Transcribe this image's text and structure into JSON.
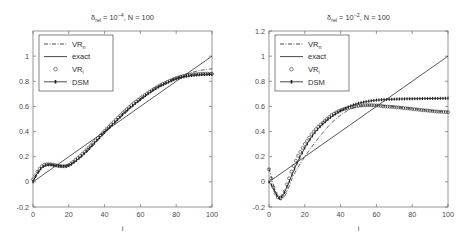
{
  "figure": {
    "background_color": "#ffffff",
    "panel_count": 2
  },
  "chart_data": [
    {
      "type": "line",
      "panel": "left",
      "title": "δ_rel = 10^-4, N = 100",
      "title_parts": {
        "delta": "δ",
        "sub": "rel",
        "eq": " = 10",
        "sup": "−4",
        "tail": ", N = 100"
      },
      "xlabel": "i",
      "ylabel": "",
      "xlim": [
        0,
        100
      ],
      "ylim": [
        -0.2,
        1.2
      ],
      "xticks": [
        0,
        20,
        40,
        60,
        80,
        100
      ],
      "xticklabels": [
        "0",
        "20",
        "40",
        "60",
        "80",
        "100"
      ],
      "yticks": [
        -0.2,
        0,
        0.2,
        0.4,
        0.6,
        0.8,
        1
      ],
      "yticklabels": [
        "-0.2",
        "0",
        "0.2",
        "0.4",
        "0.6",
        "0.8",
        "1"
      ],
      "grid": false,
      "legend_position": "upper left",
      "legend": [
        {
          "label": "VR",
          "sub": "n",
          "style": "dashdot"
        },
        {
          "label": "exact",
          "sub": "",
          "style": "solid"
        },
        {
          "label": "VR",
          "sub": "i",
          "style": "circle"
        },
        {
          "label": "DSM",
          "sub": "",
          "style": "line-marker"
        }
      ],
      "series": [
        {
          "name": "exact",
          "style": "solid",
          "x": [
            0,
            5,
            10,
            15,
            20,
            25,
            30,
            35,
            40,
            45,
            50,
            55,
            60,
            65,
            70,
            75,
            80,
            85,
            90,
            95,
            100
          ],
          "values": [
            0.0,
            0.05,
            0.1,
            0.15,
            0.2,
            0.25,
            0.3,
            0.35,
            0.4,
            0.45,
            0.5,
            0.55,
            0.6,
            0.65,
            0.7,
            0.75,
            0.8,
            0.85,
            0.9,
            0.95,
            1.0
          ]
        },
        {
          "name": "VR_n",
          "style": "dashdot",
          "x": [
            0,
            2,
            4,
            6,
            8,
            10,
            12,
            15,
            18,
            20,
            25,
            30,
            35,
            40,
            45,
            50,
            55,
            60,
            65,
            70,
            75,
            80,
            85,
            90,
            95,
            100
          ],
          "values": [
            0.01,
            0.05,
            0.09,
            0.12,
            0.13,
            0.135,
            0.135,
            0.13,
            0.13,
            0.135,
            0.175,
            0.235,
            0.31,
            0.385,
            0.455,
            0.525,
            0.59,
            0.65,
            0.705,
            0.755,
            0.795,
            0.83,
            0.855,
            0.875,
            0.89,
            0.9
          ]
        },
        {
          "name": "VR_i",
          "style": "circle",
          "x": [
            0,
            2,
            4,
            6,
            8,
            10,
            12,
            15,
            18,
            20,
            25,
            30,
            35,
            40,
            45,
            50,
            55,
            60,
            65,
            70,
            75,
            80,
            85,
            90,
            95,
            100
          ],
          "values": [
            0.02,
            0.07,
            0.11,
            0.135,
            0.14,
            0.14,
            0.135,
            0.125,
            0.125,
            0.135,
            0.19,
            0.255,
            0.33,
            0.405,
            0.475,
            0.545,
            0.61,
            0.665,
            0.715,
            0.76,
            0.795,
            0.825,
            0.845,
            0.855,
            0.86,
            0.86
          ]
        },
        {
          "name": "DSM",
          "style": "line-marker",
          "x": [
            0,
            2,
            4,
            6,
            8,
            10,
            12,
            15,
            18,
            20,
            25,
            30,
            35,
            40,
            45,
            50,
            55,
            60,
            65,
            70,
            75,
            80,
            85,
            90,
            95,
            100
          ],
          "values": [
            0.0,
            0.06,
            0.1,
            0.125,
            0.135,
            0.135,
            0.13,
            0.125,
            0.125,
            0.13,
            0.18,
            0.245,
            0.32,
            0.395,
            0.465,
            0.535,
            0.6,
            0.655,
            0.71,
            0.755,
            0.79,
            0.82,
            0.838,
            0.848,
            0.853,
            0.855
          ]
        }
      ]
    },
    {
      "type": "line",
      "panel": "right",
      "title": "δ_rel = 10^-2, N = 100",
      "title_parts": {
        "delta": "δ",
        "sub": "rel",
        "eq": " = 10",
        "sup": "−2",
        "tail": ", N = 100"
      },
      "xlabel": "i",
      "ylabel": "",
      "xlim": [
        0,
        100
      ],
      "ylim": [
        -0.2,
        1.2
      ],
      "xticks": [
        0,
        20,
        40,
        60,
        80,
        100
      ],
      "xticklabels": [
        "0",
        "20",
        "40",
        "60",
        "80",
        "100"
      ],
      "yticks": [
        -0.2,
        0,
        0.2,
        0.4,
        0.6,
        0.8,
        1,
        1.2
      ],
      "yticklabels": [
        "-0.2",
        "0",
        "0.2",
        "0.4",
        "0.6",
        "0.8",
        "1",
        "1.2"
      ],
      "grid": false,
      "legend_position": "upper left",
      "legend": [
        {
          "label": "VR",
          "sub": "n",
          "style": "dashdot"
        },
        {
          "label": "exact",
          "sub": "",
          "style": "solid"
        },
        {
          "label": "VR",
          "sub": "i",
          "style": "circle"
        },
        {
          "label": "DSM",
          "sub": "",
          "style": "line-marker"
        }
      ],
      "series": [
        {
          "name": "exact",
          "style": "solid",
          "x": [
            0,
            5,
            10,
            15,
            20,
            25,
            30,
            35,
            40,
            45,
            50,
            55,
            60,
            65,
            70,
            75,
            80,
            85,
            90,
            95,
            100
          ],
          "values": [
            0.0,
            0.05,
            0.1,
            0.15,
            0.2,
            0.25,
            0.3,
            0.35,
            0.4,
            0.45,
            0.5,
            0.55,
            0.6,
            0.65,
            0.7,
            0.75,
            0.8,
            0.85,
            0.9,
            0.95,
            1.0
          ]
        },
        {
          "name": "VR_n",
          "style": "dashdot",
          "x": [
            0,
            2,
            4,
            6,
            8,
            10,
            13,
            16,
            20,
            25,
            30,
            35,
            40,
            45,
            50,
            55,
            60,
            65,
            70,
            75,
            80,
            85,
            90,
            95,
            100
          ],
          "values": [
            0.11,
            0.0,
            -0.09,
            -0.14,
            -0.13,
            -0.08,
            0.03,
            0.11,
            0.2,
            0.3,
            0.39,
            0.47,
            0.53,
            0.575,
            0.6,
            0.61,
            0.61,
            0.605,
            0.6,
            0.59,
            0.585,
            0.575,
            0.568,
            0.562,
            0.558
          ]
        },
        {
          "name": "VR_i",
          "style": "circle",
          "x": [
            0,
            2,
            4,
            6,
            8,
            10,
            13,
            16,
            20,
            25,
            30,
            35,
            40,
            45,
            50,
            55,
            60,
            65,
            70,
            75,
            80,
            85,
            90,
            95,
            100
          ],
          "values": [
            0.1,
            -0.02,
            -0.1,
            -0.13,
            -0.1,
            -0.02,
            0.1,
            0.2,
            0.3,
            0.4,
            0.47,
            0.53,
            0.57,
            0.59,
            0.605,
            0.61,
            0.608,
            0.6,
            0.595,
            0.588,
            0.58,
            0.572,
            0.565,
            0.558,
            0.555
          ]
        },
        {
          "name": "DSM",
          "style": "line-marker",
          "x": [
            0,
            2,
            4,
            6,
            8,
            10,
            13,
            16,
            20,
            25,
            30,
            35,
            40,
            45,
            50,
            55,
            60,
            65,
            70,
            75,
            80,
            85,
            90,
            95,
            100
          ],
          "values": [
            0.0,
            -0.04,
            -0.1,
            -0.13,
            -0.1,
            -0.04,
            0.06,
            0.16,
            0.27,
            0.38,
            0.46,
            0.52,
            0.565,
            0.6,
            0.625,
            0.64,
            0.65,
            0.655,
            0.658,
            0.66,
            0.661,
            0.662,
            0.663,
            0.664,
            0.665
          ]
        }
      ]
    }
  ]
}
